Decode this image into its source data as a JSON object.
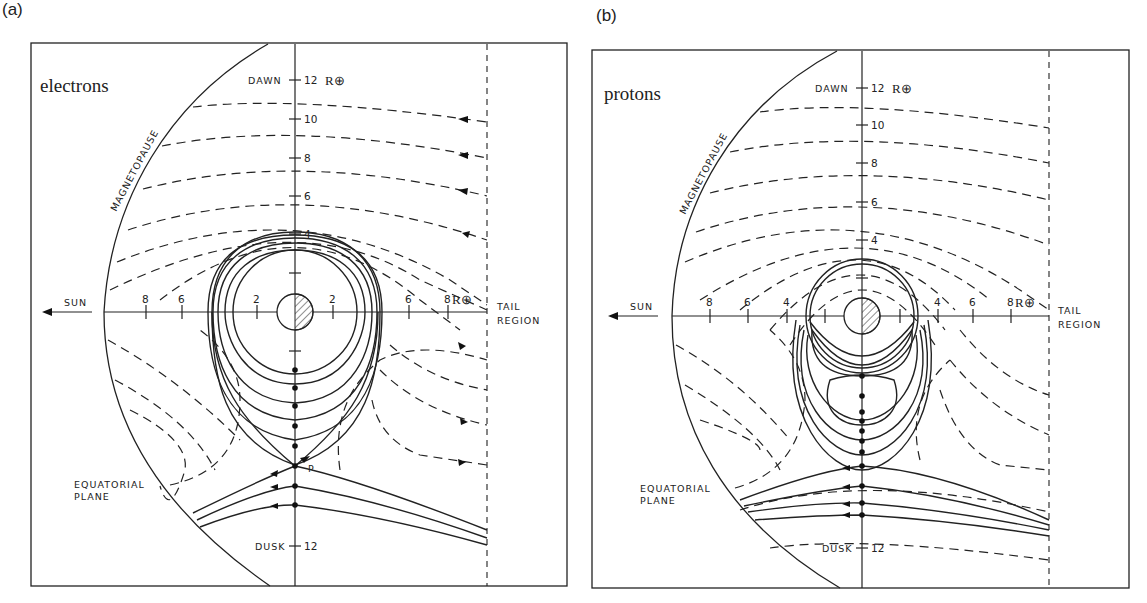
{
  "panels": [
    {
      "id": "a",
      "label": "(a)",
      "species": "electrons",
      "labels": {
        "dawn": "DAWN",
        "dusk": "DUSK",
        "sun": "SUN",
        "tail_line1": "TAIL",
        "tail_line2": "REGION",
        "eq_line1": "EQUATORIAL",
        "eq_line2": "PLANE",
        "magnetopause": "MAGNETOPAUSE",
        "x_point": "P",
        "unit": "R⊕",
        "unit_x": "R⊕"
      },
      "y_ticks": [
        "12",
        "10",
        "8",
        "6",
        "4"
      ],
      "x_ticks_left": [
        "8",
        "6",
        "2"
      ],
      "x_ticks_right": [
        "2",
        "6",
        "8"
      ],
      "dusk_tick": "12"
    },
    {
      "id": "b",
      "label": "(b)",
      "species": "protons",
      "labels": {
        "dawn": "DAWN",
        "dusk": "DUSK",
        "sun": "SUN",
        "tail_line1": "TAIL",
        "tail_line2": "REGION",
        "eq_line1": "EQUATORIAL",
        "eq_line2": "PLANE",
        "magnetopause": "MAGNETOPAUSE",
        "unit": "R⊕",
        "unit_x": "R⊕"
      },
      "y_ticks": [
        "12",
        "10",
        "8",
        "6",
        "4"
      ],
      "x_ticks_left": [
        "8",
        "6",
        "4"
      ],
      "x_ticks_right": [
        "4",
        "6",
        "8"
      ],
      "dusk_tick": "12"
    }
  ],
  "colors": {
    "ink": "#222222",
    "background": "#ffffff"
  }
}
